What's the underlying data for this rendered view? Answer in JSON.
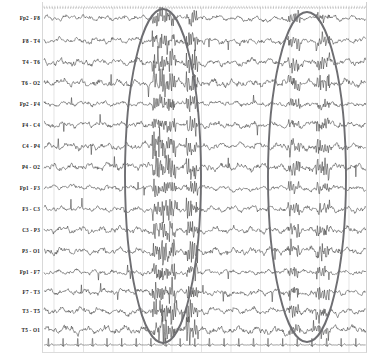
{
  "figure": {
    "type": "eeg-recording",
    "background": "#ffffff",
    "trace_color": "#3a3a3a",
    "grid_color": "#d9d9d9",
    "annotation_color": "#6e6e72",
    "width": 369,
    "height": 355,
    "plot_left": 42,
    "plot_right": 366,
    "plot_top": 8,
    "plot_bottom": 352
  },
  "channels": [
    {
      "label": "Fp2 - F8",
      "y": 18
    },
    {
      "label": "F8 - T4",
      "y": 41
    },
    {
      "label": "T4 - T6",
      "y": 62
    },
    {
      "label": "T6 - O2",
      "y": 83
    },
    {
      "label": "Fp2 - F4",
      "y": 104
    },
    {
      "label": "F4 - C4",
      "y": 125
    },
    {
      "label": "C4 - P4",
      "y": 146
    },
    {
      "label": "P4 - O2",
      "y": 167
    },
    {
      "label": "Fp1 - F3",
      "y": 188
    },
    {
      "label": "F3 - C3",
      "y": 209
    },
    {
      "label": "C3 - P3",
      "y": 230
    },
    {
      "label": "P3 - O1",
      "y": 251
    },
    {
      "label": "Fp1 - F7",
      "y": 272
    },
    {
      "label": "F7 - T3",
      "y": 292
    },
    {
      "label": "T3 - T5",
      "y": 311
    },
    {
      "label": "T5 - O1",
      "y": 330
    }
  ],
  "ecg": {
    "label": "",
    "y": 345,
    "beats": 22
  },
  "gridlines": {
    "count": 11,
    "orientation": "vertical",
    "spacing": 29.5,
    "start_x": 54
  },
  "top_ruler": {
    "y": 8,
    "style": "dotted",
    "tick_count": 120
  },
  "annotations": [
    {
      "name": "ellipse-left",
      "shape": "ellipse",
      "cx": 163,
      "cy": 176,
      "rx": 38,
      "ry": 167,
      "stroke": "#6e6e72",
      "stroke_width": 1.9
    },
    {
      "name": "ellipse-right",
      "shape": "ellipse",
      "cx": 307,
      "cy": 177,
      "rx": 39,
      "ry": 165,
      "stroke": "#6e6e72",
      "stroke_width": 1.9
    }
  ],
  "chart_data": {
    "type": "line",
    "title": "",
    "xlabel": "",
    "ylabel": "",
    "series": [
      {
        "name": "Fp2 - F8",
        "baseline": 18
      },
      {
        "name": "F8 - T4",
        "baseline": 41
      },
      {
        "name": "T4 - T6",
        "baseline": 62
      },
      {
        "name": "T6 - O2",
        "baseline": 83
      },
      {
        "name": "Fp2 - F4",
        "baseline": 104
      },
      {
        "name": "F4 - C4",
        "baseline": 125
      },
      {
        "name": "C4 - P4",
        "baseline": 146
      },
      {
        "name": "P4 - O2",
        "baseline": 167
      },
      {
        "name": "Fp1 - F3",
        "baseline": 188
      },
      {
        "name": "F3 - C3",
        "baseline": 209
      },
      {
        "name": "C3 - P3",
        "baseline": 230
      },
      {
        "name": "P3 - O1",
        "baseline": 251
      },
      {
        "name": "Fp1 - F7",
        "baseline": 272
      },
      {
        "name": "F7 - T3",
        "baseline": 292
      },
      {
        "name": "T3 - T5",
        "baseline": 311
      },
      {
        "name": "T5 - O1",
        "baseline": 330
      },
      {
        "name": "ECG",
        "baseline": 345
      }
    ]
  }
}
